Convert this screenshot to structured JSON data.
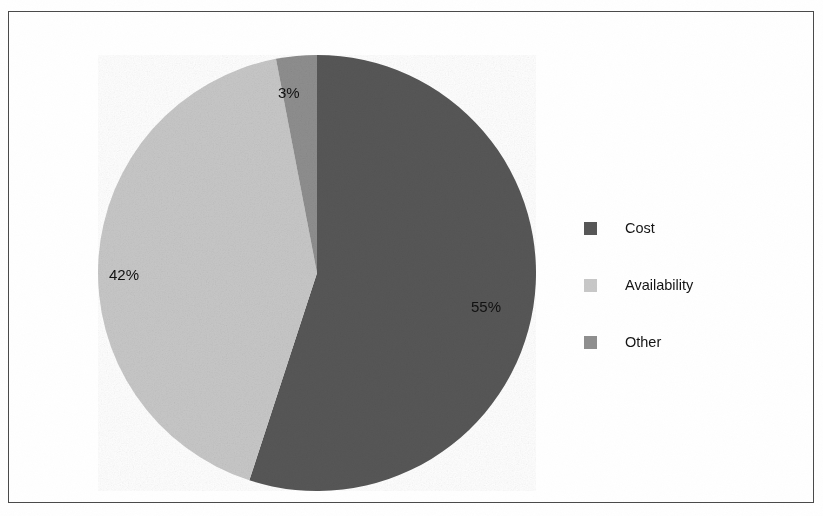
{
  "figure": {
    "border_color": "#4a4a4a",
    "background": "#ffffff"
  },
  "legend": {
    "position": "right",
    "items": [
      {
        "label": "Cost",
        "color": "#575757",
        "swatch_name": "legend-swatch-cost"
      },
      {
        "label": "Availability",
        "color": "#c8c8c8",
        "swatch_name": "legend-swatch-availability"
      },
      {
        "label": "Other",
        "color": "#8f8f8f",
        "swatch_name": "legend-swatch-other"
      }
    ]
  },
  "labels": {
    "cost": "55%",
    "availability": "42%",
    "other": "3%"
  },
  "chart_data": {
    "type": "pie",
    "title": "",
    "subtitle": "",
    "categories": [
      "Cost",
      "Availability",
      "Other"
    ],
    "values": [
      55,
      42,
      3
    ],
    "value_labels": [
      "55%",
      "42%",
      "3%"
    ],
    "colors": [
      "#575757",
      "#c8c8c8",
      "#8f8f8f"
    ],
    "units": "percent",
    "total": 100,
    "start_angle_deg": 0,
    "direction": "clockwise",
    "legend_position": "right",
    "legend_entries": [
      "Cost",
      "Availability",
      "Other"
    ],
    "labels_inside_slices": true,
    "grid": false,
    "xlabel": "",
    "ylabel": ""
  }
}
